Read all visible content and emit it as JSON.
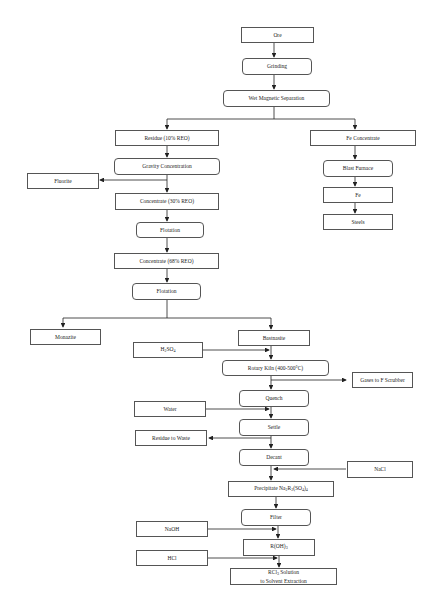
{
  "diagram": {
    "nodes": {
      "ore": "Ore",
      "grinding": "Grinding",
      "wet_magnetic_separation": "Wet Magnetic Separation",
      "residue": "Residue (10% REO)",
      "fe_concentrate": "Fe Concentrate",
      "gravity_concentration": "Gravity Concentration",
      "blast_furnace": "Blast Furnace",
      "fluorite": "Fluorite",
      "concentrate_30": "Concentrate (30% REO)",
      "fe": "Fe",
      "steels": "Steels",
      "flotation_1": "Flotation",
      "concentrate_68": "Concentrate (68% REO)",
      "flotation_2": "Flotation",
      "monazite": "Monazite",
      "bastnasite": "Bastnasite",
      "h2so4": "H2SO4",
      "rotary_kiln": "Rotary Kiln (400-500°C)",
      "gases": "Gases to F Scrubber",
      "quench": "Quench",
      "water": "Water",
      "settle": "Settle",
      "residue_waste": "Residue to Waste",
      "decant": "Decant",
      "nacl": "NaCl",
      "precipitate": "Precipitate Na2R2(SO4)4",
      "filter": "Filter",
      "naoh": "NaOH",
      "roh3": "R(OH)3",
      "hcl": "HCl",
      "rcl3_line1": "RCl3 Solution",
      "rcl3_line2": "to Solvent Extraction"
    },
    "colors": {
      "line": "#222222",
      "border": "#555555",
      "background": "#ffffff"
    }
  }
}
